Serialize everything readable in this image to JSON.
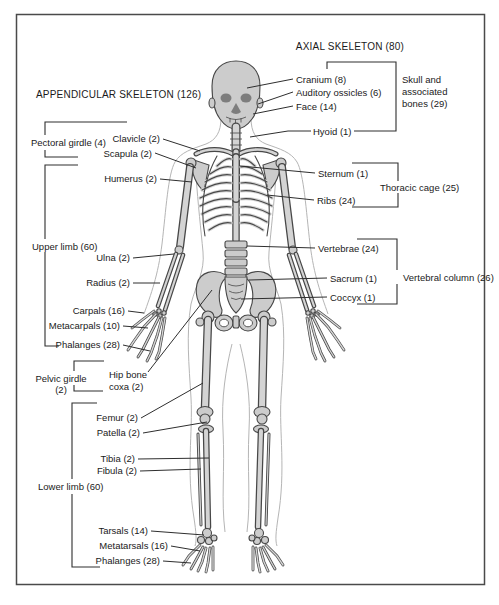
{
  "diagram": {
    "title_axial": "AXIAL SKELETON (80)",
    "title_appendicular": "APPENDICULAR SKELETON (126)",
    "labels": {
      "cranium": "Cranium (8)",
      "auditory_ossicles": "Auditory ossicles (6)",
      "face": "Face (14)",
      "skull_group_line1": "Skull and",
      "skull_group_line2": "associated",
      "skull_group_line3": "bones (29)",
      "hyoid": "Hyoid (1)",
      "pectoral_girdle": "Pectoral girdle (4)",
      "clavicle": "Clavicle (2)",
      "scapula": "Scapula (2)",
      "humerus": "Humerus (2)",
      "sternum": "Sternum (1)",
      "ribs": "Ribs (24)",
      "thoracic_cage": "Thoracic cage (25)",
      "upper_limb": "Upper limb (60)",
      "ulna": "Ulna (2)",
      "radius": "Radius (2)",
      "carpals": "Carpals (16)",
      "metacarpals": "Metacarpals (10)",
      "phalanges_hand": "Phalanges (28)",
      "vertebrae": "Vertebrae (24)",
      "sacrum": "Sacrum (1)",
      "coccyx": "Coccyx (1)",
      "vertebral_column": "Vertebral column (26)",
      "pelvic_girdle_line1": "Pelvic girdle",
      "pelvic_girdle_line2": "(2)",
      "hip_bone_line1": "Hip bone",
      "hip_bone_line2": "coxa (2)",
      "femur": "Femur (2)",
      "patella": "Patella (2)",
      "tibia": "Tibia (2)",
      "fibula": "Fibula (2)",
      "lower_limb": "Lower limb (60)",
      "tarsals": "Tarsals (14)",
      "metatarsals": "Metatarsals (16)",
      "phalanges_foot": "Phalanges (28)"
    },
    "colors": {
      "background": "#ffffff",
      "border": "#4a4a4a",
      "text": "#1a1a1a",
      "line": "#2e2e2e",
      "bone_fill": "#cccccc",
      "bone_outline": "#474747",
      "body_outline": "#b5b5b5"
    }
  }
}
